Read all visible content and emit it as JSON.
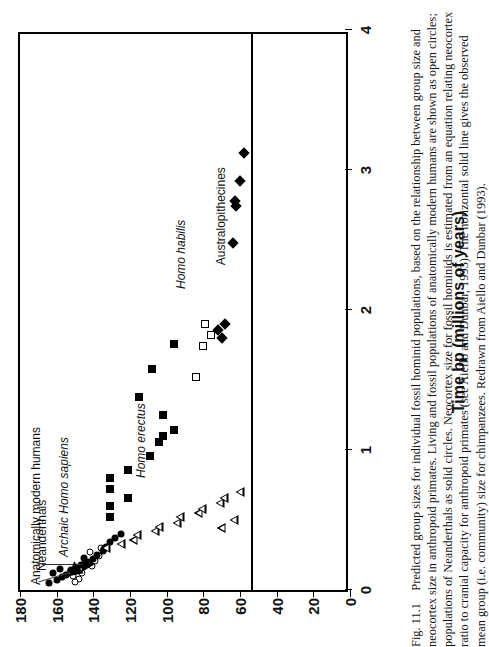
{
  "figure": {
    "caption_label": "Fig. 11.1",
    "caption_text": "Predicted group sizes for individual fossil hominid populations, based on the relationship between group size and neocortex size in anthropoid primates. Living and fossil populations of anatomically modern humans are shown as open circles; populations of Neanderthals as solid circles. Neocortex size for fossil hominids is estimated from an equation relating neocortex ratio to cranial capacity for anthropoid primates (see Aiello and Dunbar, 1993). The horizontal solid line gives the observed mean group (i.e. community) size for chimpanzees. Redrawn from Aiello and Dunbar (1993)."
  },
  "chart_data": {
    "type": "scatter",
    "title": "",
    "xlabel": "Time bp (millions of years)",
    "ylabel": "",
    "xlim": [
      0,
      4
    ],
    "ylim": [
      0,
      180
    ],
    "y_reversed": true,
    "xticks": [
      0,
      1,
      2,
      3,
      4
    ],
    "xticklabels": [
      "0",
      "1",
      "2",
      "3",
      "4"
    ],
    "yticks": [
      0,
      20,
      40,
      60,
      80,
      100,
      120,
      140,
      160,
      180
    ],
    "yticklabels": [
      "0",
      "20",
      "40",
      "60",
      "80",
      "100",
      "120",
      "140",
      "160",
      "180"
    ],
    "grid": false,
    "legend": "none",
    "reference_line": {
      "orientation": "horizontal-in-data",
      "value": 54,
      "note": "observed mean community size for chimpanzees",
      "color": "#000000"
    },
    "annotations": [
      {
        "text": "Anatomically modern humans",
        "italic": false
      },
      {
        "text": "Neanderthals",
        "italic": false
      },
      {
        "text": "Archaic Homo sapiens",
        "italic": true
      },
      {
        "text": "Homo erectus",
        "italic": true
      },
      {
        "text": "Homo habilis",
        "italic": true
      },
      {
        "text": "Australopithecines",
        "italic": false
      }
    ],
    "series": [
      {
        "name": "Anatomically modern humans",
        "marker": "open-circle",
        "points": [
          [
            0.08,
            148
          ],
          [
            0.1,
            151
          ],
          [
            0.12,
            146
          ],
          [
            0.13,
            153
          ],
          [
            0.17,
            141
          ],
          [
            0.19,
            144
          ],
          [
            0.21,
            139
          ],
          [
            0.24,
            137
          ],
          [
            0.27,
            142
          ],
          [
            0.3,
            136
          ],
          [
            0.06,
            150
          ]
        ]
      },
      {
        "name": "Neanderthals",
        "marker": "solid-circle",
        "points": [
          [
            0.05,
            164
          ],
          [
            0.07,
            160
          ],
          [
            0.09,
            157
          ],
          [
            0.11,
            155
          ],
          [
            0.14,
            152
          ],
          [
            0.16,
            149
          ],
          [
            0.18,
            147
          ],
          [
            0.2,
            143
          ],
          [
            0.22,
            140
          ],
          [
            0.25,
            138
          ],
          [
            0.28,
            135
          ],
          [
            0.31,
            133
          ],
          [
            0.34,
            131
          ],
          [
            0.37,
            128
          ],
          [
            0.4,
            125
          ],
          [
            0.15,
            158
          ],
          [
            0.23,
            145
          ],
          [
            0.29,
            134
          ],
          [
            0.12,
            162
          ]
        ]
      },
      {
        "name": "Archaic Homo sapiens",
        "marker": "open-triangle",
        "points": [
          [
            0.3,
            133
          ],
          [
            0.33,
            130
          ],
          [
            0.36,
            128
          ],
          [
            0.39,
            131
          ],
          [
            0.42,
            126
          ],
          [
            0.45,
            129
          ],
          [
            0.48,
            124
          ],
          [
            0.52,
            127
          ],
          [
            0.55,
            122
          ],
          [
            0.58,
            125
          ],
          [
            0.62,
            120
          ],
          [
            0.66,
            123
          ],
          [
            0.7,
            119
          ],
          [
            0.44,
            134
          ],
          [
            0.5,
            132
          ]
        ]
      },
      {
        "name": "Homo erectus",
        "marker": "solid-square",
        "points": [
          [
            0.52,
            131
          ],
          [
            0.6,
            131
          ],
          [
            0.66,
            121
          ],
          [
            0.72,
            131
          ],
          [
            0.86,
            121
          ],
          [
            0.96,
            109
          ],
          [
            1.06,
            104
          ],
          [
            1.1,
            102
          ],
          [
            1.14,
            96
          ],
          [
            1.25,
            102
          ],
          [
            1.38,
            115
          ],
          [
            1.58,
            108
          ],
          [
            1.76,
            96
          ],
          [
            0.8,
            131
          ]
        ]
      },
      {
        "name": "Homo habilis",
        "marker": "open-square",
        "points": [
          [
            1.52,
            84
          ],
          [
            1.74,
            80
          ],
          [
            1.82,
            76
          ],
          [
            1.9,
            79
          ]
        ]
      },
      {
        "name": "Australopithecines",
        "marker": "solid-diamond",
        "points": [
          [
            1.8,
            70
          ],
          [
            1.86,
            72
          ],
          [
            1.9,
            68
          ],
          [
            2.48,
            64
          ],
          [
            2.74,
            62
          ],
          [
            2.78,
            63
          ],
          [
            2.92,
            60
          ],
          [
            3.12,
            58
          ]
        ]
      }
    ]
  }
}
